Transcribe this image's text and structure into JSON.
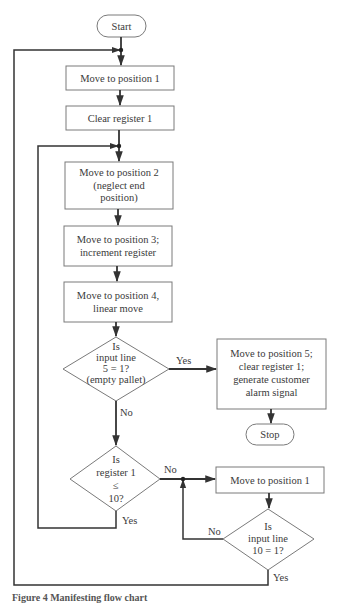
{
  "diagram": {
    "type": "flowchart",
    "nodes": {
      "start": {
        "shape": "terminal",
        "label": "Start"
      },
      "move_pos1_a": {
        "shape": "process",
        "lines": [
          "Move to position 1"
        ]
      },
      "clear_reg1": {
        "shape": "process",
        "lines": [
          "Clear register 1"
        ]
      },
      "move_pos2": {
        "shape": "process",
        "lines": [
          "Move to position 2",
          "(neglect end",
          "position)"
        ]
      },
      "move_pos3": {
        "shape": "process",
        "lines": [
          "Move to position 3;",
          "increment register"
        ]
      },
      "move_pos4": {
        "shape": "process",
        "lines": [
          "Move to position 4,",
          "linear move"
        ]
      },
      "decision_input5": {
        "shape": "decision",
        "lines": [
          "Is",
          "input line",
          "5 = 1?",
          "(empty pallet)"
        ]
      },
      "move_pos5": {
        "shape": "process",
        "lines": [
          "Move to position 5;",
          "clear register 1;",
          "generate customer",
          "alarm signal"
        ]
      },
      "stop": {
        "shape": "terminal",
        "label": "Stop"
      },
      "decision_reg1": {
        "shape": "decision",
        "lines": [
          "Is",
          "register 1",
          "≤",
          "10?"
        ]
      },
      "move_pos1_b": {
        "shape": "process",
        "lines": [
          "Move to position 1"
        ]
      },
      "decision_input10": {
        "shape": "decision",
        "lines": [
          "Is",
          "input line",
          "10 = 1?"
        ]
      }
    },
    "edge_labels": {
      "input5_yes": "Yes",
      "input5_no": "No",
      "reg1_no": "No",
      "reg1_yes": "Yes",
      "input10_no": "No",
      "input10_yes": "Yes"
    },
    "edges": [
      {
        "from": "start",
        "to": "move_pos1_a"
      },
      {
        "from": "move_pos1_a",
        "to": "clear_reg1"
      },
      {
        "from": "clear_reg1",
        "to": "move_pos2"
      },
      {
        "from": "move_pos2",
        "to": "move_pos3"
      },
      {
        "from": "move_pos3",
        "to": "move_pos4"
      },
      {
        "from": "move_pos4",
        "to": "decision_input5"
      },
      {
        "from": "decision_input5",
        "to": "move_pos5",
        "label": "Yes"
      },
      {
        "from": "move_pos5",
        "to": "stop"
      },
      {
        "from": "decision_input5",
        "to": "decision_reg1",
        "label": "No"
      },
      {
        "from": "decision_reg1",
        "to": "move_pos1_b",
        "label": "No"
      },
      {
        "from": "decision_reg1",
        "to": "move_pos2",
        "label": "Yes"
      },
      {
        "from": "move_pos1_b",
        "to": "decision_input10"
      },
      {
        "from": "decision_input10",
        "to": "move_pos1_b",
        "label": "No"
      },
      {
        "from": "decision_input10",
        "to": "move_pos1_a",
        "label": "Yes"
      }
    ]
  },
  "caption": "Figure 4  Manifesting flow chart"
}
